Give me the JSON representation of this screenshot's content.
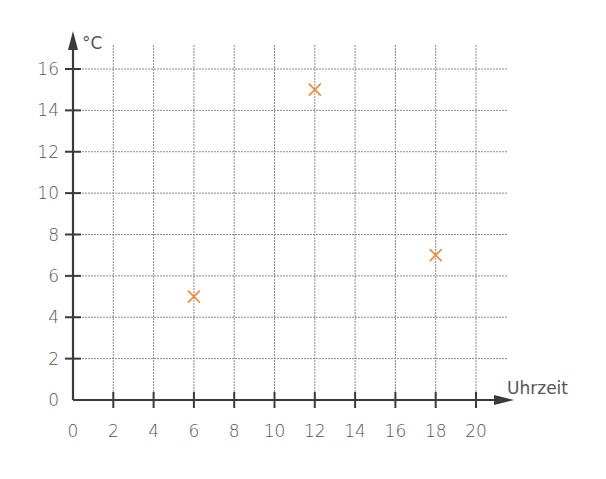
{
  "chart_data": {
    "type": "scatter",
    "title": "",
    "xlabel": "Uhrzeit",
    "ylabel": "°C",
    "xlim": [
      0,
      20
    ],
    "ylim": [
      0,
      16
    ],
    "x_ticks": [
      0,
      2,
      4,
      6,
      8,
      10,
      12,
      14,
      16,
      18,
      20
    ],
    "y_ticks": [
      0,
      2,
      4,
      6,
      8,
      10,
      12,
      14,
      16
    ],
    "grid": true,
    "legend": null,
    "marker": "x",
    "marker_color": "#f0883a",
    "series": [
      {
        "name": "Temperatur",
        "points": [
          {
            "x": 6,
            "y": 5
          },
          {
            "x": 12,
            "y": 15
          },
          {
            "x": 18,
            "y": 7
          }
        ]
      }
    ]
  },
  "colors": {
    "axis": "#3a3a3a",
    "grid": "#8a8a8a",
    "label": "#555555",
    "marker": "#f0883a"
  }
}
